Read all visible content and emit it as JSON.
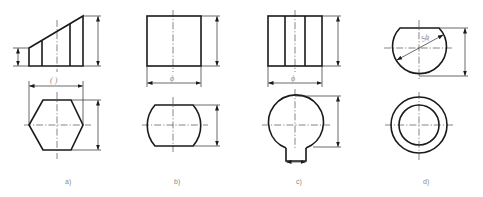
{
  "figure": {
    "type": "orthographic-projection-drawing",
    "panels": [
      {
        "id": "a",
        "caption": "a)",
        "front_view": "truncated wedge with 3 vertical edges",
        "top_view": "hexagon",
        "width_dim_text": "( )"
      },
      {
        "id": "b",
        "caption": "b)",
        "front_view": "rectangle",
        "top_view": "cylinder with two flats",
        "width_dim_text": "ϕ"
      },
      {
        "id": "c",
        "caption": "c)",
        "front_view": "rectangle with 2 vertical edges",
        "top_view": "circle with keyway",
        "width_dim_text": "ϕ"
      },
      {
        "id": "d",
        "caption": "d)",
        "front_view": "truncated sphere",
        "top_view": "two concentric circles",
        "diameter_dim_text": "Sϕ"
      }
    ]
  },
  "colors": {
    "outline": "#1a1a1a",
    "dimension": "#2a2a2a",
    "label": "#8a8a8a",
    "background": "#ffffff"
  }
}
